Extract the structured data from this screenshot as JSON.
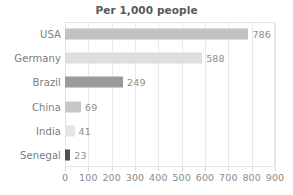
{
  "chart_data": {
    "type": "bar",
    "orientation": "horizontal",
    "title": "Per 1,000 people",
    "xlabel": "",
    "ylabel": "",
    "xlim": [
      0,
      900
    ],
    "xticks": [
      "0",
      "100",
      "200",
      "300",
      "400",
      "500",
      "600",
      "700",
      "800",
      "900"
    ],
    "grid": true,
    "legend": false,
    "categories": [
      "USA",
      "Germany",
      "Brazil",
      "China",
      "India",
      "Senegal"
    ],
    "values": [
      786,
      588,
      249,
      69,
      41,
      23
    ],
    "value_labels": [
      "786",
      "588",
      "249",
      "69",
      "41",
      "23"
    ],
    "bar_colors": [
      "#c2c2c2",
      "#dedede",
      "#9a9a9a",
      "#c8c8c8",
      "#e4e4e4",
      "#4f4f4f"
    ]
  },
  "style": {
    "background": "#ffffff",
    "title_color": "#59595b",
    "category_label_color": "#7c7c7e",
    "value_label_color": "#8d8d8f",
    "tick_label_color": "#8a8a8c",
    "gridline_color": "#e8e8e8",
    "frame_color": "#e3e3e3"
  }
}
